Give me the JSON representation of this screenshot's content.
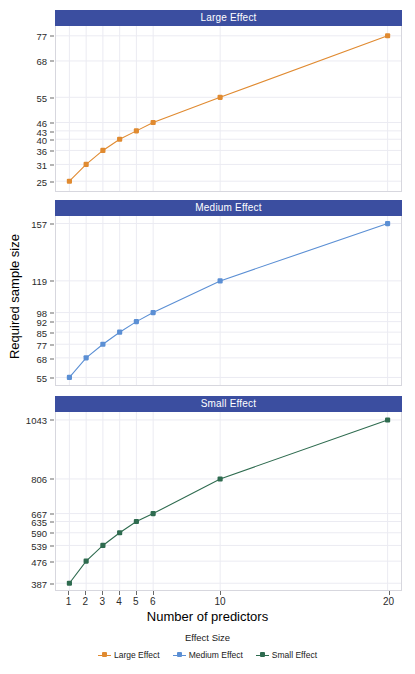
{
  "chart_data": {
    "type": "line",
    "title": "",
    "xlabel": "Number of predictors",
    "ylabel": "Required sample size",
    "x": [
      1,
      2,
      3,
      4,
      5,
      6,
      10,
      20
    ],
    "xticks": [
      "1",
      "2",
      "3",
      "4",
      "5",
      "6",
      "10",
      "20"
    ],
    "xlim": [
      0.2,
      20.8
    ],
    "grid": true,
    "legend": {
      "title": "Effect Size",
      "position": "bottom"
    },
    "facet_layout": "vertical-3",
    "series": [
      {
        "name": "Large Effect",
        "facet": "Large Effect",
        "color": "#E08A30",
        "values": [
          25,
          31,
          36,
          40,
          43,
          46,
          55,
          77
        ],
        "yticks": [
          "25",
          "31",
          "36",
          "40",
          "43",
          "46",
          "55",
          "68",
          "77"
        ],
        "ytickvals": [
          25,
          31,
          36,
          40,
          43,
          46,
          55,
          68,
          77
        ],
        "ylim": [
          21.5,
          80.5
        ]
      },
      {
        "name": "Medium Effect",
        "facet": "Medium Effect",
        "color": "#5B8FD4",
        "values": [
          55,
          68,
          77,
          85,
          92,
          98,
          119,
          157
        ],
        "yticks": [
          "55",
          "68",
          "77",
          "85",
          "92",
          "98",
          "119",
          "157"
        ],
        "ytickvals": [
          55,
          68,
          77,
          85,
          92,
          98,
          119,
          157
        ],
        "ylim": [
          50,
          162
        ]
      },
      {
        "name": "Small Effect",
        "facet": "Small Effect",
        "color": "#2E6B4F",
        "values": [
          387,
          476,
          539,
          590,
          635,
          667,
          806,
          1043
        ],
        "yticks": [
          "387",
          "476",
          "539",
          "590",
          "635",
          "667",
          "806",
          "1043"
        ],
        "ytickvals": [
          387,
          476,
          539,
          590,
          635,
          667,
          806,
          1043
        ],
        "ylim": [
          360,
          1075
        ]
      }
    ],
    "colors": {
      "strip_background": "#3b4ea0",
      "strip_text": "#ffffff",
      "panel_background": "#ffffff",
      "grid": "#ebebf2",
      "large_effect": "#E08A30",
      "medium_effect": "#5B8FD4",
      "small_effect": "#2E6B4F"
    }
  },
  "facets": [
    {
      "label": "Large Effect"
    },
    {
      "label": "Medium Effect"
    },
    {
      "label": "Small Effect"
    }
  ],
  "axes": {
    "x_title": "Number of predictors",
    "y_title": "Required sample size"
  },
  "legend": {
    "title": "Effect Size",
    "items": [
      {
        "label": "Large Effect",
        "color": "#E08A30"
      },
      {
        "label": "Medium Effect",
        "color": "#5B8FD4"
      },
      {
        "label": "Small Effect",
        "color": "#2E6B4F"
      }
    ]
  }
}
